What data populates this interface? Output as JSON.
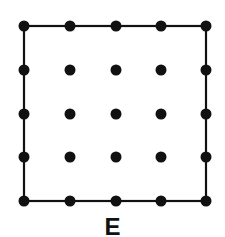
{
  "figure": {
    "label": "E",
    "grid": {
      "xs": [
        24,
        70,
        116,
        161,
        206
      ],
      "ys": [
        26,
        70,
        114,
        157,
        201
      ],
      "dot_radius": 5.5
    },
    "square": {
      "x1": 24,
      "y1": 26,
      "x2": 206,
      "y2": 201
    },
    "colors": {
      "ink": "#111111",
      "background": "#ffffff"
    }
  }
}
